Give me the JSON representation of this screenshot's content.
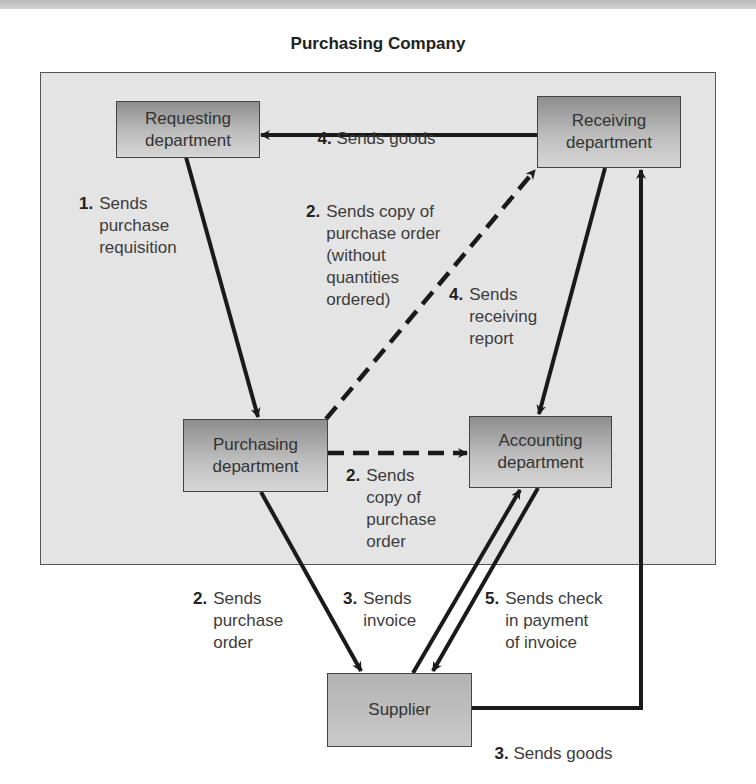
{
  "title": "Purchasing Company",
  "nodes": {
    "requesting": "Requesting\ndepartment",
    "receiving": "Receiving\ndepartment",
    "purchasing": "Purchasing\ndepartment",
    "accounting": "Accounting\ndepartment",
    "supplier": "Supplier"
  },
  "labels": {
    "sends_goods_4": {
      "num": "4.",
      "text": "Sends goods"
    },
    "requisition_1": {
      "num": "1.",
      "text": "Sends\npurchase\nrequisition"
    },
    "copy_po_receiving_2": {
      "num": "2.",
      "text": "Sends copy of\npurchase order\n(without\nquantities\nordered)"
    },
    "receiving_report_4": {
      "num": "4.",
      "text": "Sends\nreceiving\nreport"
    },
    "copy_po_accounting_2": {
      "num": "2.",
      "text": "Sends\ncopy of\npurchase\norder"
    },
    "purchase_order_2": {
      "num": "2.",
      "text": "Sends\npurchase\norder"
    },
    "invoice_3": {
      "num": "3.",
      "text": "Sends\ninvoice"
    },
    "check_5": {
      "num": "5.",
      "text": "Sends check\nin payment\nof invoice"
    },
    "goods_3": {
      "num": "3.",
      "text": "Sends goods"
    }
  },
  "colors": {
    "container_bg": "#e4e4e4",
    "node_dark": "#8d8d8d",
    "node_light": "#d6d6d6",
    "arrow": "#1a1a1a"
  }
}
